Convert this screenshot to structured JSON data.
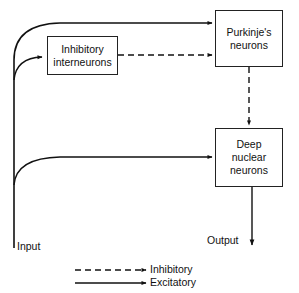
{
  "diagram": {
    "nodes": {
      "interneurons": {
        "line1": "Inhibitory",
        "line2": "interneurons"
      },
      "purkinje": {
        "line1": "Purkinje's",
        "line2": "neurons"
      },
      "deep_nuclear": {
        "line1": "Deep",
        "line2": "nuclear",
        "line3": "neurons"
      }
    },
    "labels": {
      "input": "Input",
      "output": "Output"
    },
    "edges": [
      {
        "from": "input",
        "to": "purkinje",
        "type": "excitatory"
      },
      {
        "from": "input",
        "to": "interneurons",
        "type": "excitatory"
      },
      {
        "from": "input",
        "to": "deep_nuclear",
        "type": "excitatory"
      },
      {
        "from": "interneurons",
        "to": "purkinje",
        "type": "inhibitory"
      },
      {
        "from": "purkinje",
        "to": "deep_nuclear",
        "type": "inhibitory"
      },
      {
        "from": "deep_nuclear",
        "to": "output",
        "type": "excitatory"
      }
    ],
    "legend": {
      "inhibitory": "Inhibitory",
      "excitatory": "Excitatory"
    },
    "colors": {
      "line": "#111111",
      "background": "#ffffff"
    }
  }
}
